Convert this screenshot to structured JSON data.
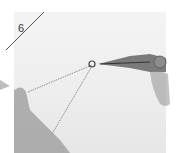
{
  "figure": {
    "step_number": "6",
    "colors": {
      "background": "#ffffff",
      "photo_bg": "#eeeeee",
      "pliers": "#6e6e6e",
      "chain": "#8a8a8a",
      "hand": "#9a9a9a",
      "slash_line": "#555555"
    }
  }
}
